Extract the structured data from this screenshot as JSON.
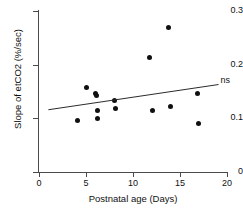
{
  "chart_data": {
    "type": "scatter",
    "title": "",
    "xlabel": "Postnatal age (Days)",
    "ylabel": "Slope of etCO2 (%/sec)",
    "xlim": [
      0,
      20
    ],
    "ylim": [
      0,
      0.3
    ],
    "xticks": [
      0,
      5,
      10,
      15,
      20
    ],
    "xtick_labels": [
      "0",
      "5",
      "10",
      "15",
      "20"
    ],
    "yticks": [
      0,
      0.1,
      0.2,
      0.3
    ],
    "ytick_labels": [
      "0",
      "0.1",
      "0.2",
      "0.3"
    ],
    "grid": false,
    "legend": "none",
    "points": [
      {
        "x": 4.1,
        "y": 0.096
      },
      {
        "x": 5.1,
        "y": 0.157
      },
      {
        "x": 6.0,
        "y": 0.147
      },
      {
        "x": 6.1,
        "y": 0.143
      },
      {
        "x": 6.2,
        "y": 0.114
      },
      {
        "x": 6.2,
        "y": 0.1
      },
      {
        "x": 8.0,
        "y": 0.133
      },
      {
        "x": 8.1,
        "y": 0.119
      },
      {
        "x": 11.8,
        "y": 0.214
      },
      {
        "x": 12.1,
        "y": 0.114
      },
      {
        "x": 13.8,
        "y": 0.27
      },
      {
        "x": 14.0,
        "y": 0.122
      },
      {
        "x": 16.9,
        "y": 0.147
      },
      {
        "x": 17.0,
        "y": 0.091
      }
    ],
    "fit_line": {
      "x_start": 1.0,
      "y_start": 0.116,
      "x_end": 19.1,
      "y_end": 0.163,
      "annotation": "ns"
    }
  }
}
